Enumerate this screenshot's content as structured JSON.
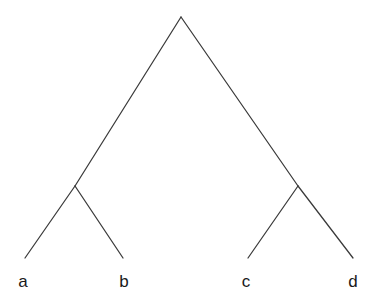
{
  "figure": {
    "type": "cladogram",
    "background_color": "#ffffff",
    "line_color": "#3a3a3a",
    "label_color": "#1a1a1a",
    "width": 386,
    "height": 307
  },
  "chart_data": {
    "type": "diagram",
    "title": "",
    "subtitle": "",
    "xlabel": "",
    "ylabel": "",
    "grid": false,
    "legend": "none",
    "topology": "((a,b),(c,d))",
    "nodes": [
      {
        "id": "root",
        "kind": "internal",
        "x": 181,
        "y": 17,
        "label": ""
      },
      {
        "id": "n1",
        "kind": "internal",
        "x": 75,
        "y": 186,
        "label": ""
      },
      {
        "id": "n2",
        "kind": "internal",
        "x": 298,
        "y": 186,
        "label": ""
      },
      {
        "id": "a",
        "kind": "leaf",
        "x": 25,
        "y": 258,
        "label": "a"
      },
      {
        "id": "b",
        "kind": "leaf",
        "x": 123,
        "y": 258,
        "label": "b"
      },
      {
        "id": "c",
        "kind": "leaf",
        "x": 248,
        "y": 258,
        "label": "c"
      },
      {
        "id": "d",
        "kind": "leaf",
        "x": 353,
        "y": 258,
        "label": "d"
      }
    ],
    "edges": [
      {
        "id": "root-n1",
        "from": "root",
        "to": "n1",
        "x1": 181,
        "y1": 17,
        "x2": 75,
        "y2": 186
      },
      {
        "id": "root-n2",
        "from": "root",
        "to": "n2",
        "x1": 181,
        "y1": 17,
        "x2": 298,
        "y2": 186
      },
      {
        "id": "n1-a",
        "from": "n1",
        "to": "a",
        "x1": 75,
        "y1": 186,
        "x2": 25,
        "y2": 258
      },
      {
        "id": "n1-b",
        "from": "n1",
        "to": "b",
        "x1": 75,
        "y1": 186,
        "x2": 123,
        "y2": 258
      },
      {
        "id": "n2-c",
        "from": "n2",
        "to": "c",
        "x1": 298,
        "y1": 186,
        "x2": 248,
        "y2": 258
      },
      {
        "id": "n2-d",
        "from": "n2",
        "to": "d",
        "x1": 298,
        "y1": 186,
        "x2": 353,
        "y2": 258
      }
    ],
    "leaf_labels": [
      {
        "text": "a",
        "x": 23,
        "y": 287
      },
      {
        "text": "b",
        "x": 124,
        "y": 287
      },
      {
        "text": "c",
        "x": 246,
        "y": 287
      },
      {
        "text": "d",
        "x": 353,
        "y": 287
      }
    ]
  }
}
